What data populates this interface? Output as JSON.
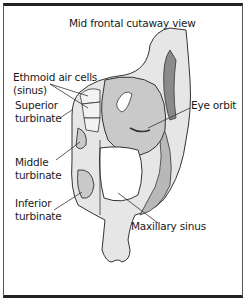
{
  "title": "Mid frontal cutaway view",
  "labels": {
    "ethmoid_line1": "Ethmoid air cells",
    "ethmoid_line2": "(sinus)",
    "superior_line1": "Superior",
    "superior_line2": "turbinate",
    "middle_line1": "Middle",
    "middle_line2": "turbinate",
    "inferior_line1": "Inferior",
    "inferior_line2": "turbinate",
    "eye_orbit": "Eye orbit",
    "maxillary_sinus": "Maxillary sinus"
  },
  "colors": {
    "tissue": "#d9d9d9",
    "tissue_dark": "#b0b0b0",
    "outline": "#333333",
    "border": "#222222"
  }
}
